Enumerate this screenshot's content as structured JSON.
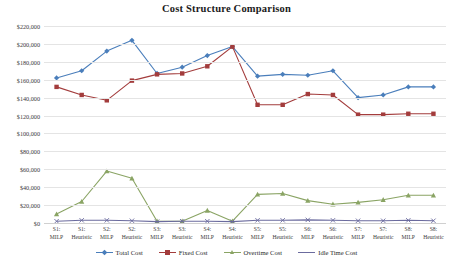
{
  "chart": {
    "title": "Cost Structure Comparison"
  },
  "chart_data": {
    "type": "line",
    "title": "Cost Structure Comparison",
    "xlabel": "",
    "ylabel": "",
    "ylim": [
      0,
      220000
    ],
    "ytick_step": 20000,
    "grid": true,
    "legend_position": "bottom",
    "ytick_labels": [
      "$220,000",
      "$200,000",
      "$180,000",
      "$160,000",
      "$140,000",
      "$120,000",
      "$100,000",
      "$80,000",
      "$60,000",
      "$40,000",
      "$20,000",
      "$0"
    ],
    "ytick_values": [
      220000,
      200000,
      180000,
      160000,
      140000,
      120000,
      100000,
      80000,
      60000,
      40000,
      20000,
      0
    ],
    "categories": [
      "S1: MILP",
      "S1: Heuristic",
      "S2: MILP",
      "S2: Heuristic",
      "S3: MILP",
      "S3: Heuristic",
      "S4: MILP",
      "S4: Heuristic",
      "S5: MILP",
      "S5: Heuristic",
      "S6: MILP",
      "S6: Heuristic",
      "S7: MILP",
      "S7: Heuristic",
      "S8: MILP",
      "S8: Heuristic"
    ],
    "category_lines": [
      [
        "S1:",
        "MILP"
      ],
      [
        "S1:",
        "Heuristic"
      ],
      [
        "S2:",
        "MILP"
      ],
      [
        "S2:",
        "Heuristic"
      ],
      [
        "S3:",
        "MILP"
      ],
      [
        "S3:",
        "Heuristic"
      ],
      [
        "S4:",
        "MILP"
      ],
      [
        "S4:",
        "Heuristic"
      ],
      [
        "S5:",
        "MILP"
      ],
      [
        "S5:",
        "Heuristic"
      ],
      [
        "S6:",
        "MILP"
      ],
      [
        "S6:",
        "Heuristic"
      ],
      [
        "S7:",
        "MILP"
      ],
      [
        "S7:",
        "Heuristic"
      ],
      [
        "S8:",
        "MILP"
      ],
      [
        "S8:",
        "Heuristic"
      ]
    ],
    "series": [
      {
        "name": "Total Cost",
        "color": "#4a7ebb",
        "marker": "diamond",
        "values": [
          162000,
          170000,
          192000,
          204000,
          167000,
          174000,
          187000,
          197000,
          164000,
          166000,
          165000,
          170000,
          140000,
          143000,
          152000,
          152000
        ]
      },
      {
        "name": "Fixed Cost",
        "color": "#a33c3c",
        "marker": "square",
        "values": [
          152000,
          143000,
          137000,
          159000,
          166000,
          167000,
          175000,
          197000,
          132000,
          132000,
          144000,
          143000,
          121000,
          121000,
          122000,
          122000
        ]
      },
      {
        "name": "Overtime Cost",
        "color": "#8aa464",
        "marker": "triangle",
        "values": [
          10000,
          24000,
          58000,
          50000,
          2000,
          2000,
          14000,
          2000,
          32000,
          33000,
          25000,
          21000,
          23000,
          26000,
          31000,
          31000
        ]
      },
      {
        "name": "Idle Time Cost",
        "color": "#6b6b9e",
        "marker": "x",
        "values": [
          2000,
          3000,
          3000,
          2500,
          1500,
          2000,
          2000,
          1500,
          3000,
          3000,
          3500,
          3000,
          2500,
          2500,
          3000,
          2500
        ]
      }
    ]
  },
  "legend": {
    "items": [
      {
        "label": "Total Cost",
        "color": "#4a7ebb"
      },
      {
        "label": "Fixed Cost",
        "color": "#a33c3c"
      },
      {
        "label": "Overtime Cost",
        "color": "#8aa464"
      },
      {
        "label": "Idle Time Cost",
        "color": "#6b6b9e"
      }
    ]
  }
}
